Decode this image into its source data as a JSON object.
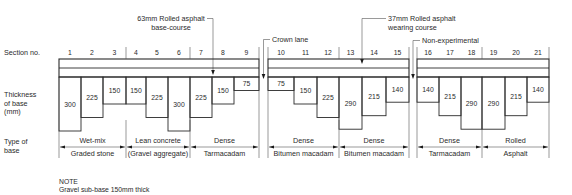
{
  "row_labels": {
    "section_no": "Section no.",
    "thickness_line1": "Thickness",
    "thickness_line2": "of base",
    "thickness_line3": "(mm)",
    "type_line1": "Type of",
    "type_line2": "base"
  },
  "annotations": {
    "base_course_line1": "63mm Rolled asphalt",
    "base_course_line2": "base-course",
    "crown_lane": "Crown lane",
    "wearing_course_line1": "37mm Rolled asphalt",
    "wearing_course_line2": "wearing course",
    "non_experimental": "Non-experimental"
  },
  "note": {
    "title": "NOTE",
    "text": "Gravel sub-base 150mm thick"
  },
  "sections": [
    {
      "no": "1",
      "thickness": 300
    },
    {
      "no": "2",
      "thickness": 225
    },
    {
      "no": "3",
      "thickness": 150
    },
    {
      "no": "4",
      "thickness": 150
    },
    {
      "no": "5",
      "thickness": 225
    },
    {
      "no": "6",
      "thickness": 300
    },
    {
      "no": "7",
      "thickness": 225
    },
    {
      "no": "8",
      "thickness": 150
    },
    {
      "no": "9",
      "thickness": 75
    },
    {
      "no": "10",
      "thickness": 75
    },
    {
      "no": "11",
      "thickness": 150
    },
    {
      "no": "12",
      "thickness": 225
    },
    {
      "no": "13",
      "thickness": 290
    },
    {
      "no": "14",
      "thickness": 215
    },
    {
      "no": "15",
      "thickness": 140
    },
    {
      "no": "16",
      "thickness": 140
    },
    {
      "no": "17",
      "thickness": 215
    },
    {
      "no": "18",
      "thickness": 290
    },
    {
      "no": "19",
      "thickness": 290
    },
    {
      "no": "20",
      "thickness": 215
    },
    {
      "no": "21",
      "thickness": 140
    }
  ],
  "base_types": [
    {
      "sections": "1-3",
      "top": "Wet-mix",
      "bottom": "Graded stone"
    },
    {
      "sections": "4-6",
      "top": "Lean concrete",
      "bottom": "(Gravel aggregate)"
    },
    {
      "sections": "7-9",
      "top": "Dense",
      "bottom": "Tarmacadam"
    },
    {
      "sections": "10-12",
      "top": "Dense",
      "bottom": "Bitumen macadam"
    },
    {
      "sections": "13-15",
      "top": "Dense",
      "bottom": "Bitumen macadam"
    },
    {
      "sections": "16-18",
      "top": "Dense",
      "bottom": "Tarmacadam"
    },
    {
      "sections": "19-21",
      "top": "Rolled",
      "bottom": "Asphalt"
    }
  ],
  "colors": {
    "line": "#2a2a2a",
    "background": "#ffffff"
  }
}
